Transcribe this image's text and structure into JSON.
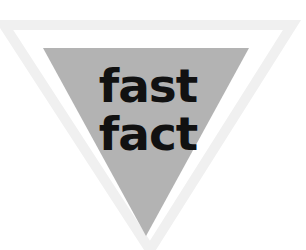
{
  "badge": {
    "line1": "fast",
    "line2": "fact",
    "shape": "inverted-triangle",
    "fill_color": "#b3b3b3",
    "outline_color": "#f2f2f2",
    "text_color": "#111111"
  }
}
